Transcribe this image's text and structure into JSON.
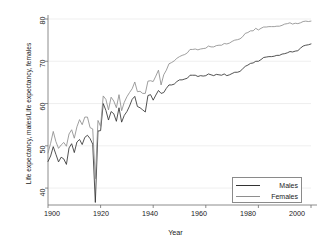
{
  "chart_data": {
    "type": "line",
    "title": "",
    "subtitle": "",
    "xlabel": "Year",
    "ylabel": "Life expectancy, males/Life expectancy, females",
    "xlim": [
      1900,
      2000
    ],
    "ylim": [
      36,
      80
    ],
    "xticks": [
      1900,
      1920,
      1940,
      1960,
      1980,
      2000
    ],
    "yticks": [
      40,
      50,
      60,
      70,
      80
    ],
    "grid": "horizontal-faint",
    "legend_position": "bottom-right",
    "series": [
      {
        "name": "Males",
        "color": "#333333",
        "x": [
          1900,
          1901,
          1902,
          1903,
          1904,
          1905,
          1906,
          1907,
          1908,
          1909,
          1910,
          1911,
          1912,
          1913,
          1914,
          1915,
          1916,
          1917,
          1918,
          1919,
          1920,
          1921,
          1922,
          1923,
          1924,
          1925,
          1926,
          1927,
          1928,
          1929,
          1930,
          1931,
          1932,
          1933,
          1934,
          1935,
          1936,
          1937,
          1938,
          1939,
          1940,
          1941,
          1942,
          1943,
          1944,
          1945,
          1946,
          1947,
          1948,
          1949,
          1950,
          1951,
          1952,
          1953,
          1954,
          1955,
          1956,
          1957,
          1958,
          1959,
          1960,
          1961,
          1962,
          1963,
          1964,
          1965,
          1966,
          1967,
          1968,
          1969,
          1970,
          1971,
          1972,
          1973,
          1974,
          1975,
          1976,
          1977,
          1978,
          1979,
          1980,
          1981,
          1982,
          1983,
          1984,
          1985,
          1986,
          1987,
          1988,
          1989,
          1990,
          1991,
          1992,
          1993,
          1994,
          1995,
          1996,
          1997,
          1998,
          1999,
          2000
        ],
        "values": [
          46.3,
          47.6,
          49.8,
          48.0,
          46.2,
          47.3,
          46.9,
          45.6,
          49.5,
          50.5,
          48.4,
          50.9,
          51.5,
          50.3,
          52.0,
          52.5,
          51.7,
          50.4,
          36.6,
          53.5,
          53.6,
          60.0,
          58.4,
          56.1,
          58.1,
          57.6,
          55.8,
          59.0,
          55.6,
          57.2,
          58.1,
          59.4,
          61.0,
          61.7,
          59.3,
          59.0,
          58.5,
          58.0,
          61.9,
          62.1,
          60.8,
          62.0,
          63.1,
          62.4,
          62.6,
          63.6,
          64.4,
          64.4,
          64.6,
          65.2,
          65.6,
          65.6,
          65.8,
          66.0,
          66.7,
          66.7,
          66.7,
          66.4,
          66.6,
          66.5,
          66.6,
          67.0,
          66.8,
          66.6,
          66.9,
          66.8,
          66.7,
          67.0,
          66.6,
          66.8,
          67.1,
          67.4,
          67.4,
          67.6,
          68.2,
          68.8,
          69.1,
          69.5,
          69.6,
          70.0,
          70.0,
          70.4,
          70.9,
          71.0,
          71.1,
          71.1,
          71.2,
          71.4,
          71.4,
          71.7,
          71.8,
          72.0,
          72.3,
          72.2,
          72.4,
          72.5,
          73.1,
          73.6,
          73.8,
          73.9,
          74.1
        ]
      },
      {
        "name": "Females",
        "color": "#8e8e8e",
        "x": [
          1900,
          1901,
          1902,
          1903,
          1904,
          1905,
          1906,
          1907,
          1908,
          1909,
          1910,
          1911,
          1912,
          1913,
          1914,
          1915,
          1916,
          1917,
          1918,
          1919,
          1920,
          1921,
          1922,
          1923,
          1924,
          1925,
          1926,
          1927,
          1928,
          1929,
          1930,
          1931,
          1932,
          1933,
          1934,
          1935,
          1936,
          1937,
          1938,
          1939,
          1940,
          1941,
          1942,
          1943,
          1944,
          1945,
          1946,
          1947,
          1948,
          1949,
          1950,
          1951,
          1952,
          1953,
          1954,
          1955,
          1956,
          1957,
          1958,
          1959,
          1960,
          1961,
          1962,
          1963,
          1964,
          1965,
          1966,
          1967,
          1968,
          1969,
          1970,
          1971,
          1972,
          1973,
          1974,
          1975,
          1976,
          1977,
          1978,
          1979,
          1980,
          1981,
          1982,
          1983,
          1984,
          1985,
          1986,
          1987,
          1988,
          1989,
          1990,
          1991,
          1992,
          1993,
          1994,
          1995,
          1996,
          1997,
          1998,
          1999,
          2000
        ],
        "values": [
          48.3,
          50.6,
          53.4,
          51.0,
          49.4,
          50.2,
          50.8,
          49.9,
          52.8,
          53.8,
          51.8,
          54.5,
          56.2,
          55.0,
          56.8,
          56.8,
          54.3,
          54.0,
          42.2,
          56.0,
          54.6,
          61.8,
          61.0,
          58.5,
          61.5,
          60.6,
          59.0,
          62.1,
          58.3,
          60.3,
          61.6,
          62.6,
          63.5,
          65.1,
          62.8,
          62.9,
          62.4,
          62.4,
          65.3,
          65.4,
          65.2,
          66.5,
          67.9,
          64.4,
          66.8,
          67.9,
          69.4,
          69.7,
          70.1,
          70.7,
          71.1,
          71.4,
          71.6,
          72.0,
          72.8,
          72.8,
          72.9,
          72.7,
          72.9,
          73.0,
          73.1,
          73.6,
          73.4,
          73.4,
          73.7,
          73.8,
          73.8,
          74.2,
          74.1,
          74.3,
          74.7,
          75.0,
          75.1,
          75.3,
          75.8,
          76.6,
          76.8,
          77.2,
          77.2,
          77.8,
          77.4,
          77.8,
          78.1,
          78.1,
          78.2,
          78.2,
          78.2,
          78.3,
          78.3,
          78.5,
          78.8,
          78.9,
          79.1,
          78.8,
          79.0,
          78.9,
          79.1,
          79.4,
          79.5,
          79.4,
          79.5
        ]
      }
    ]
  },
  "axes": {
    "xlabel": "Year",
    "ylabel": "Life expectancy, males/Life expectancy, females",
    "xticks": [
      "1900",
      "1920",
      "1940",
      "1960",
      "1980",
      "2000"
    ],
    "yticks": [
      "40",
      "50",
      "60",
      "70",
      "80"
    ]
  },
  "legend": {
    "entries": [
      {
        "label": "Males",
        "color": "#333333"
      },
      {
        "label": "Females",
        "color": "#8e8e8e"
      }
    ]
  },
  "colors": {
    "males": "#333333",
    "females": "#8e8e8e",
    "axis": "#6e6e6e",
    "grid": "#e8e8e8",
    "background": "#ffffff",
    "text": "#1a1a1a"
  }
}
